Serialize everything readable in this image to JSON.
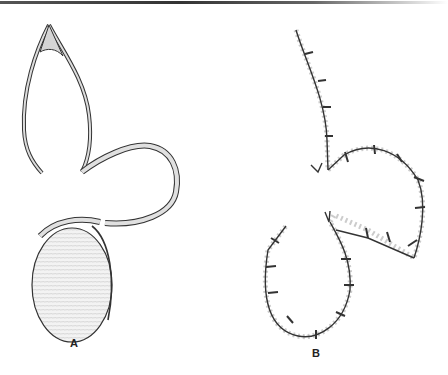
{
  "figure": {
    "panels": [
      {
        "id": "A",
        "label": "A",
        "description": "Flap with pointed loop and circular pad attached by a band"
      },
      {
        "id": "B",
        "label": "B",
        "description": "Sutured outline of the flap showing interrupted stitches"
      }
    ]
  },
  "colors": {
    "ink": "#222222",
    "band_fill": "#d9d9d9",
    "pad_fill": "#f2f2f2",
    "background": "#ffffff"
  }
}
